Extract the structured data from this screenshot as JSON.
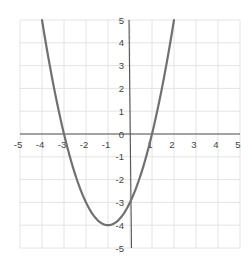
{
  "chart_data": {
    "type": "line",
    "title": "",
    "xlabel": "",
    "ylabel": "",
    "function": "y = x^2 + 2x - 3",
    "xlim": [
      -5,
      5
    ],
    "ylim": [
      -5,
      5
    ],
    "grid": true,
    "x_ticks": [
      "-5",
      "-4",
      "-3",
      "-2",
      "-1",
      "0",
      "1",
      "2",
      "3",
      "4",
      "5"
    ],
    "y_ticks": [
      "5",
      "4",
      "3",
      "2",
      "1",
      "0",
      "-1",
      "-2",
      "-3",
      "-4",
      "-5"
    ],
    "series": [
      {
        "name": "parabola",
        "x": [
          -3.9,
          -3.5,
          -3,
          -2.5,
          -2,
          -1.5,
          -1,
          -0.5,
          0,
          0.5,
          1,
          1.5,
          1.9
        ],
        "y": [
          4.41,
          2.25,
          0,
          -1.75,
          -3,
          -3.75,
          -4,
          -3.75,
          -3,
          -1.75,
          0,
          2.25,
          4.41
        ]
      }
    ],
    "features": {
      "roots": [
        -3,
        1
      ],
      "vertex": [
        -1,
        -4
      ],
      "y_intercept": -3
    },
    "colors": {
      "curve": "#707070",
      "axis": "#555555",
      "grid": "#e4e4e4",
      "label": "#444444"
    }
  }
}
